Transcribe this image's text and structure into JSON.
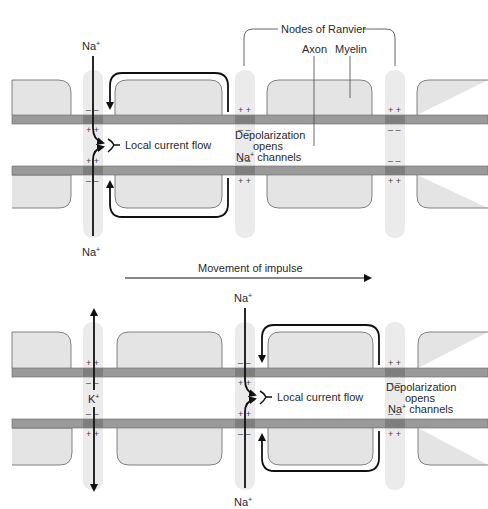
{
  "labels": {
    "nodes_of_ranvier": "Nodes of Ranvier",
    "axon": "Axon",
    "myelin": "Myelin",
    "movement": "Movement of impulse",
    "local_current_top": "Local current flow",
    "local_current_bottom": "Local current flow",
    "depol_top_l1": "Depolarization",
    "depol_top_l2": "opens",
    "depol_top_l3": "channels",
    "depol_bot_l1": "Depolarization",
    "depol_bot_l2": "opens",
    "depol_bot_l3": "channels",
    "na": "Na",
    "k": "K",
    "plus": "+",
    "charge_pos": "+ +",
    "charge_neg": "– –"
  },
  "ions": {
    "top_in_upper": "Na+",
    "top_in_lower": "Na+",
    "bottom_in_upper": "Na+",
    "bottom_in_lower": "Na+",
    "bottom_out": "K+"
  },
  "colors": {
    "axon_band": "#9a9a9a",
    "axon_node": "#7e7e7e",
    "myelin_fill": "#e4e4e4",
    "myelin_stroke": "#555555",
    "node_fill": "#ebebeb",
    "arrow": "#111111"
  }
}
